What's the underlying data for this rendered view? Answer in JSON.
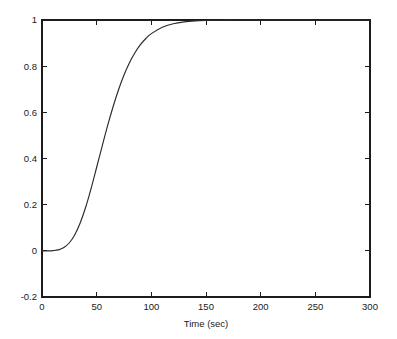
{
  "figure": {
    "background_color": "#ffffff",
    "axis_color": "#1c1c1c",
    "curve_color": "#2b2b2b"
  },
  "chart_data": {
    "type": "line",
    "title": "",
    "subtitle": "",
    "xlabel": "Time (sec)",
    "ylabel": "",
    "xlim": [
      0,
      300
    ],
    "ylim": [
      -0.2,
      1.0
    ],
    "xticks": [
      0,
      50,
      100,
      150,
      200,
      250,
      300
    ],
    "xtick_labels": [
      "0",
      "50",
      "100",
      "150",
      "200",
      "250",
      "300"
    ],
    "yticks": [
      -0.2,
      0,
      0.2,
      0.4,
      0.6,
      0.8,
      1
    ],
    "ytick_labels": [
      "-0.2",
      "0",
      "0.2",
      "0.4",
      "0.6",
      "0.8",
      "1"
    ],
    "grid": false,
    "legend": null,
    "legend_position": "none",
    "annotations": [],
    "series": [
      {
        "name": "step response",
        "color": "#2b2b2b",
        "linewidth": 1.15,
        "x": [
          0,
          5,
          10,
          15,
          20,
          25,
          30,
          35,
          40,
          45,
          50,
          55,
          60,
          65,
          70,
          75,
          80,
          85,
          90,
          95,
          100,
          110,
          120,
          130,
          140,
          150,
          160,
          170,
          180,
          190,
          200,
          220,
          240,
          260,
          280,
          300
        ],
        "y": [
          0.0,
          0.0,
          0.001,
          0.004,
          0.014,
          0.035,
          0.07,
          0.122,
          0.19,
          0.272,
          0.362,
          0.453,
          0.542,
          0.624,
          0.698,
          0.762,
          0.815,
          0.858,
          0.893,
          0.92,
          0.941,
          0.969,
          0.984,
          0.992,
          0.996,
          0.998,
          0.999,
          0.9995,
          0.9998,
          0.9999,
          1.0,
          1.0,
          1.0,
          1.0,
          1.0,
          1.0
        ]
      }
    ]
  },
  "axes_geometry": {
    "left_px": 42,
    "right_px": 370,
    "top_px": 20,
    "bottom_px": 297
  }
}
